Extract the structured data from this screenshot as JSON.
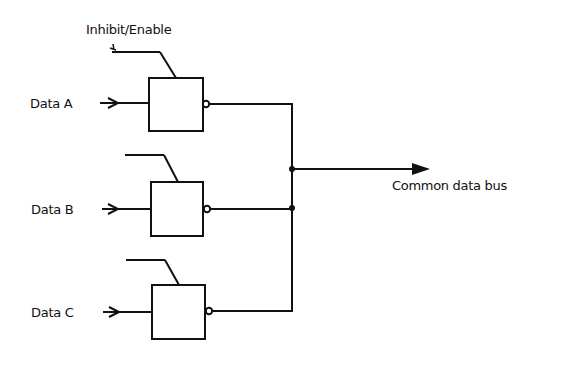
{
  "diagram": {
    "control_label": "Inhibit/Enable",
    "output_label": "Common data bus",
    "inputs": [
      {
        "label": "Data A"
      },
      {
        "label": "Data B"
      },
      {
        "label": "Data C"
      }
    ],
    "colors": {
      "line": "#111111",
      "background": "#ffffff"
    }
  }
}
